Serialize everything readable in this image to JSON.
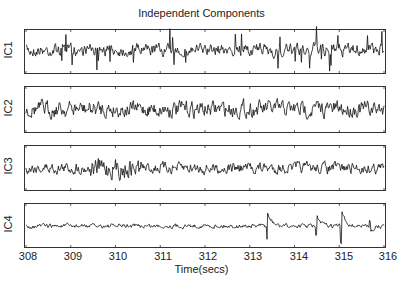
{
  "chart_data": {
    "type": "line",
    "title": "Independent Components",
    "xlabel": "Time(secs)",
    "ylabel": "",
    "xlim": [
      308,
      316
    ],
    "x_ticks": [
      "308",
      "309",
      "310",
      "311",
      "312",
      "313",
      "314",
      "315",
      "316"
    ],
    "grid": false,
    "legend": null,
    "series": [
      {
        "name": "IC1",
        "description": "dense noisy signal with frequent downward spikes"
      },
      {
        "name": "IC2",
        "description": "oscillatory signal, moderate amplitude"
      },
      {
        "name": "IC3",
        "description": "noisy signal with high-amplitude burst around 309.5-310.5"
      },
      {
        "name": "IC4",
        "description": "low-amplitude baseline with large transients near 313.4, 314.5, 315.0, 315.7"
      }
    ]
  },
  "labels": {
    "title": "Independent Components",
    "xlabel": "Time(secs)",
    "panels": [
      "IC1",
      "IC2",
      "IC3",
      "IC4"
    ],
    "ticks": [
      "308",
      "309",
      "310",
      "311",
      "312",
      "313",
      "314",
      "315",
      "316"
    ]
  }
}
